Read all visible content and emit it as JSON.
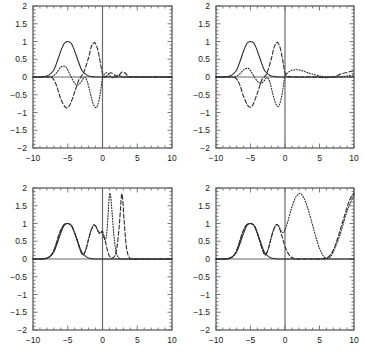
{
  "figure": {
    "layout": "2x2 panel grid",
    "background": "#ffffff",
    "line_color": "#2b2b2b",
    "axis_color": "#6b6b6b"
  },
  "axes": {
    "x_ticks": [
      "-10",
      "-5",
      "0",
      "5",
      "10"
    ],
    "x_tick_values": [
      -10,
      -5,
      0,
      5,
      10
    ],
    "y_ticks": [
      "2",
      "1.5",
      "1",
      "0.5",
      "0",
      "-0.5",
      "-1",
      "-1.5",
      "-2"
    ],
    "y_tick_values": [
      2,
      1.5,
      1,
      0.5,
      0,
      -0.5,
      -1,
      -1.5,
      -2
    ],
    "xlim": [
      -10,
      10
    ],
    "ylim": [
      -2,
      2
    ],
    "x_minor_per_major": 5,
    "y_minor_per_major": 5
  },
  "chart_data": [
    {
      "type": "line",
      "panel": "top-left",
      "title": "",
      "xlabel": "",
      "ylabel": "",
      "xlim": [
        -10,
        10
      ],
      "ylim": [
        -2,
        2
      ],
      "grid": false,
      "legend": "none",
      "zero_lines": true,
      "series": [
        {
          "name": "incident-gaussian",
          "style": "solid",
          "x": [
            -10,
            -9,
            -8.5,
            -8,
            -7.5,
            -7,
            -6.5,
            -6,
            -5.5,
            -5,
            -4.5,
            -4,
            -3.5,
            -3,
            -2.5,
            -2,
            -1.5,
            -1,
            -0.5,
            0,
            0.5,
            1,
            2,
            3,
            5,
            7,
            10
          ],
          "y": [
            0,
            0,
            0.01,
            0.03,
            0.09,
            0.2,
            0.45,
            0.73,
            0.95,
            1.0,
            0.95,
            0.73,
            0.45,
            0.2,
            0.09,
            0.03,
            0.01,
            0,
            0,
            0,
            0,
            0,
            0,
            0,
            0,
            0,
            0
          ]
        },
        {
          "name": "scattered-dashed",
          "style": "dashed",
          "x": [
            -10,
            -8,
            -7.2,
            -6.6,
            -6,
            -5.4,
            -5,
            -4.6,
            -4,
            -3.4,
            -3,
            -2.6,
            -2,
            -1.6,
            -1.2,
            -1,
            -0.7,
            -0.4,
            -0.2,
            0,
            0.3,
            0.6,
            0.9,
            1.2,
            1.6,
            2,
            2.4,
            2.8,
            3.2,
            3.6,
            4,
            5,
            6,
            8,
            10
          ],
          "y": [
            0,
            0,
            -0.03,
            -0.25,
            -0.62,
            -0.84,
            -0.86,
            -0.75,
            -0.42,
            -0.08,
            0.03,
            0.18,
            0.55,
            0.86,
            0.97,
            0.93,
            0.78,
            0.5,
            0.28,
            0.1,
            0.0,
            0.03,
            0.09,
            0.12,
            0.08,
            0.02,
            0.06,
            0.14,
            0.12,
            0.04,
            0.0,
            0,
            0,
            0,
            0
          ]
        },
        {
          "name": "scattered-dotted",
          "style": "dotted",
          "x": [
            -10,
            -8,
            -7.2,
            -6.6,
            -6,
            -5.4,
            -5,
            -4.5,
            -4,
            -3.5,
            -3,
            -2.6,
            -2.2,
            -1.8,
            -1.4,
            -1,
            -0.7,
            -0.4,
            -0.2,
            0,
            0.3,
            0.6,
            1,
            1.4,
            1.8,
            2.2,
            2.6,
            3,
            3.4,
            3.8,
            4.2,
            5,
            6,
            8,
            10
          ],
          "y": [
            0,
            0,
            0.02,
            0.12,
            0.28,
            0.3,
            0.2,
            0.0,
            -0.18,
            -0.22,
            -0.12,
            0.0,
            -0.12,
            -0.42,
            -0.72,
            -0.86,
            -0.8,
            -0.55,
            -0.3,
            -0.04,
            0.08,
            0.12,
            0.05,
            -0.02,
            0.0,
            0.05,
            0.03,
            -0.01,
            0.0,
            0.0,
            0.0,
            0,
            0,
            0,
            0
          ]
        }
      ]
    },
    {
      "type": "line",
      "panel": "top-right",
      "title": "",
      "xlabel": "",
      "ylabel": "",
      "xlim": [
        -10,
        10
      ],
      "ylim": [
        -2,
        2
      ],
      "grid": false,
      "legend": "none",
      "zero_lines": true,
      "series": [
        {
          "name": "incident-gaussian",
          "style": "solid",
          "x": [
            -10,
            -9,
            -8.5,
            -8,
            -7.5,
            -7,
            -6.5,
            -6,
            -5.5,
            -5,
            -4.5,
            -4,
            -3.5,
            -3,
            -2.5,
            -2,
            -1.5,
            -1,
            -0.5,
            0,
            1,
            3,
            5,
            7,
            10
          ],
          "y": [
            0,
            0,
            0.01,
            0.03,
            0.09,
            0.2,
            0.45,
            0.73,
            0.95,
            1.0,
            0.95,
            0.73,
            0.45,
            0.2,
            0.09,
            0.03,
            0.01,
            0,
            0,
            0,
            0,
            0,
            0,
            0,
            0
          ]
        },
        {
          "name": "scattered-dashed",
          "style": "dashed",
          "x": [
            -10,
            -8,
            -7.2,
            -6.6,
            -6,
            -5.4,
            -5,
            -4.6,
            -4,
            -3.4,
            -3,
            -2.6,
            -2,
            -1.6,
            -1.2,
            -1,
            -0.7,
            -0.4,
            -0.2,
            0,
            0.4,
            1,
            1.6,
            2.2,
            3,
            4,
            5,
            6,
            7,
            7.6,
            8.2,
            9,
            9.6,
            10
          ],
          "y": [
            0,
            0,
            -0.02,
            -0.2,
            -0.55,
            -0.8,
            -0.85,
            -0.76,
            -0.45,
            -0.1,
            0.0,
            0.12,
            0.5,
            0.82,
            0.97,
            0.95,
            0.82,
            0.55,
            0.32,
            0.12,
            0.02,
            0.0,
            0.0,
            0.0,
            0.0,
            0.0,
            -0.01,
            -0.02,
            0.0,
            0.04,
            0.09,
            0.13,
            0.16,
            0.17
          ]
        },
        {
          "name": "scattered-dotted",
          "style": "dotted",
          "x": [
            -10,
            -8,
            -7.2,
            -6.6,
            -6,
            -5.4,
            -5,
            -4.5,
            -4,
            -3.5,
            -3,
            -2.6,
            -2.2,
            -1.8,
            -1.4,
            -1,
            -0.7,
            -0.4,
            -0.2,
            0,
            0.4,
            0.9,
            1.4,
            2,
            2.6,
            3.2,
            4,
            5,
            6,
            7,
            8,
            9,
            10
          ],
          "y": [
            0,
            0,
            0.01,
            0.08,
            0.2,
            0.25,
            0.18,
            0.02,
            -0.12,
            -0.18,
            -0.1,
            -0.02,
            -0.14,
            -0.45,
            -0.72,
            -0.83,
            -0.72,
            -0.45,
            -0.2,
            0.03,
            0.12,
            0.18,
            0.2,
            0.2,
            0.17,
            0.13,
            0.08,
            0.03,
            0.0,
            0.0,
            0.01,
            0.03,
            0.06
          ]
        }
      ]
    },
    {
      "type": "line",
      "panel": "bottom-left",
      "title": "",
      "xlabel": "",
      "ylabel": "",
      "xlim": [
        -10,
        10
      ],
      "ylim": [
        -2,
        2
      ],
      "grid": false,
      "legend": "none",
      "zero_lines": true,
      "series": [
        {
          "name": "incident-envelope",
          "style": "solid",
          "x": [
            -10,
            -9,
            -8.5,
            -8,
            -7.5,
            -7,
            -6.5,
            -6,
            -5.5,
            -5,
            -4.5,
            -4,
            -3.5,
            -3,
            -2.5,
            -2,
            -1.5,
            -1,
            0,
            2,
            5,
            10
          ],
          "y": [
            0,
            0,
            0.01,
            0.03,
            0.09,
            0.2,
            0.45,
            0.73,
            0.95,
            1.0,
            0.95,
            0.73,
            0.45,
            0.2,
            0.09,
            0.03,
            0.01,
            0,
            0,
            0,
            0,
            0
          ]
        },
        {
          "name": "envelope-dashed",
          "style": "dashed",
          "x": [
            -10,
            -8.5,
            -8,
            -7.4,
            -6.8,
            -6.2,
            -5.6,
            -5,
            -4.4,
            -3.8,
            -3.2,
            -2.8,
            -2.4,
            -2,
            -1.6,
            -1.2,
            -0.9,
            -0.6,
            -0.3,
            0,
            0.4,
            0.9,
            1.4,
            1.8,
            2.1,
            2.4,
            2.6,
            2.75,
            2.9,
            3.1,
            3.3,
            3.5,
            3.8,
            4.2,
            5,
            7,
            10
          ],
          "y": [
            0,
            0,
            0.02,
            0.1,
            0.35,
            0.72,
            0.95,
            1.0,
            0.92,
            0.62,
            0.25,
            0.12,
            0.25,
            0.55,
            0.82,
            0.95,
            0.9,
            0.78,
            0.72,
            0.78,
            0.5,
            0.12,
            0.03,
            0.1,
            0.35,
            0.9,
            1.45,
            1.82,
            1.7,
            1.1,
            0.6,
            0.25,
            0.06,
            0.0,
            0,
            0,
            0
          ]
        },
        {
          "name": "envelope-dotted",
          "style": "dotted",
          "x": [
            -10,
            -8.5,
            -8,
            -7.4,
            -6.8,
            -6.2,
            -5.6,
            -5,
            -4.4,
            -3.8,
            -3.2,
            -2.8,
            -2.4,
            -2,
            -1.6,
            -1.2,
            -0.95,
            -0.7,
            -0.45,
            -0.2,
            0,
            0.2,
            0.45,
            0.65,
            0.8,
            0.95,
            1.05,
            1.2,
            1.4,
            1.6,
            1.85,
            2.1,
            2.5,
            3,
            4,
            6,
            10
          ],
          "y": [
            0,
            0,
            0.02,
            0.1,
            0.35,
            0.72,
            0.95,
            1.0,
            0.92,
            0.62,
            0.25,
            0.12,
            0.28,
            0.58,
            0.85,
            0.97,
            0.92,
            0.8,
            0.72,
            0.75,
            0.72,
            0.6,
            0.55,
            0.8,
            1.25,
            1.7,
            1.85,
            1.72,
            1.25,
            0.75,
            0.32,
            0.1,
            0.01,
            0.0,
            0,
            0,
            0
          ]
        }
      ]
    },
    {
      "type": "line",
      "panel": "bottom-right",
      "title": "",
      "xlabel": "",
      "ylabel": "",
      "xlim": [
        -10,
        10
      ],
      "ylim": [
        -2,
        2
      ],
      "grid": false,
      "legend": "none",
      "zero_lines": true,
      "series": [
        {
          "name": "incident-envelope",
          "style": "solid",
          "x": [
            -10,
            -9,
            -8.5,
            -8,
            -7.5,
            -7,
            -6.5,
            -6,
            -5.5,
            -5,
            -4.5,
            -4,
            -3.5,
            -3,
            -2.5,
            -2,
            -1.5,
            -1,
            0,
            2,
            5,
            10
          ],
          "y": [
            0,
            0,
            0.01,
            0.03,
            0.09,
            0.2,
            0.45,
            0.73,
            0.95,
            1.0,
            0.95,
            0.73,
            0.45,
            0.2,
            0.09,
            0.03,
            0.01,
            0,
            0,
            0,
            0,
            0
          ]
        },
        {
          "name": "envelope-dashed",
          "style": "dashed",
          "x": [
            -10,
            -8.5,
            -8,
            -7.4,
            -6.8,
            -6.2,
            -5.6,
            -5,
            -4.4,
            -3.8,
            -3.2,
            -2.8,
            -2.4,
            -2,
            -1.6,
            -1.2,
            -0.9,
            -0.6,
            -0.3,
            0,
            0.4,
            0.8,
            1.2,
            1.6,
            2,
            2.6,
            3.4,
            4.4,
            5.4,
            6.2,
            6.8,
            7.4,
            8,
            8.6,
            9.2,
            9.6,
            10
          ],
          "y": [
            0,
            0,
            0.02,
            0.1,
            0.35,
            0.72,
            0.95,
            1.0,
            0.92,
            0.6,
            0.22,
            0.12,
            0.3,
            0.6,
            0.85,
            0.97,
            0.92,
            0.75,
            0.55,
            0.35,
            0.18,
            0.07,
            0.02,
            0.0,
            0.0,
            0.0,
            0.0,
            0.0,
            0.01,
            0.05,
            0.18,
            0.45,
            0.82,
            1.2,
            1.58,
            1.75,
            1.85
          ]
        },
        {
          "name": "envelope-dotted",
          "style": "dotted",
          "x": [
            -10,
            -8.5,
            -8,
            -7.4,
            -6.8,
            -6.2,
            -5.6,
            -5,
            -4.4,
            -3.8,
            -3.2,
            -2.8,
            -2.4,
            -2,
            -1.6,
            -1.2,
            -0.9,
            -0.6,
            -0.3,
            0,
            0.4,
            0.9,
            1.4,
            1.8,
            2.1,
            2.5,
            3,
            3.5,
            4,
            4.5,
            5,
            5.5,
            6,
            6.5,
            7,
            8,
            9,
            10
          ],
          "y": [
            0,
            0,
            0.02,
            0.1,
            0.35,
            0.72,
            0.95,
            1.0,
            0.92,
            0.6,
            0.22,
            0.12,
            0.3,
            0.6,
            0.85,
            0.97,
            0.92,
            0.8,
            0.75,
            0.82,
            1.05,
            1.4,
            1.68,
            1.8,
            1.85,
            1.8,
            1.6,
            1.3,
            0.95,
            0.6,
            0.3,
            0.1,
            0.02,
            0.05,
            0.2,
            0.7,
            1.35,
            1.8
          ]
        }
      ]
    }
  ]
}
